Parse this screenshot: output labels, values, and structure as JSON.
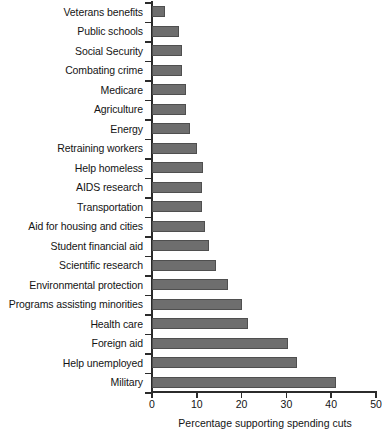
{
  "chart_data": {
    "type": "bar",
    "orientation": "horizontal",
    "title": "",
    "xlabel": "Percentage supporting spending cuts",
    "ylabel": "",
    "xlim": [
      0,
      50
    ],
    "xticks": [
      0,
      10,
      20,
      30,
      40,
      50
    ],
    "grid": false,
    "legend": null,
    "bar_color": "#6e6e6e",
    "categories": [
      "Veterans benefits",
      "Public schools",
      "Social Security",
      "Combating crime",
      "Medicare",
      "Agriculture",
      "Energy",
      "Retraining workers",
      "Help homeless",
      "AIDS research",
      "Transportation",
      "Aid for housing and cities",
      "Student financial aid",
      "Scientific research",
      "Environmental protection",
      "Programs assisting minorities",
      "Health care",
      "Foreign aid",
      "Help unemployed",
      "Military"
    ],
    "values": [
      3,
      6,
      6.6,
      6.7,
      7.6,
      7.6,
      8.5,
      10,
      11.4,
      11.2,
      11.2,
      11.8,
      12.7,
      14.3,
      17,
      20,
      21.4,
      30.4,
      32.4,
      41
    ]
  }
}
